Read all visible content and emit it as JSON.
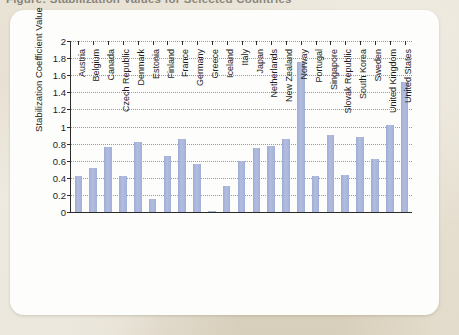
{
  "page": {
    "background_color": "#e8e2d4",
    "card_color": "#fdfdfb",
    "cropped_caption": "Figure: Stabilization Values for Selected Countries"
  },
  "chart_data": {
    "type": "bar",
    "title": "",
    "xlabel": "",
    "ylabel": "Stabilization Coefficient Value",
    "ylim": [
      0,
      2
    ],
    "ytick_step": 0.2,
    "ytick_labels": [
      "0",
      "0.2",
      "0.4",
      "0.6",
      "0.8",
      "1",
      "1.2",
      "1.4",
      "1.6",
      "1.8",
      "2"
    ],
    "grid": true,
    "grid_style": "dotted-horizontal",
    "legend": "none",
    "bar_color": "#a9b6da",
    "axis_color": "#2b2b2b",
    "categories": [
      "Austria",
      "Belgium",
      "Canada",
      "Czech Republic",
      "Denmark",
      "Estonia",
      "Finland",
      "France",
      "Germany",
      "Greece",
      "Iceland",
      "Italy",
      "Japan",
      "Netherlands",
      "New Zealand",
      "Norway",
      "Portugal",
      "Singapore",
      "Slovak Republic",
      "South Korea",
      "Sweden",
      "United Kingdom",
      "United States"
    ],
    "values": [
      0.42,
      0.51,
      0.76,
      0.42,
      0.82,
      0.15,
      0.66,
      0.85,
      0.56,
      0.01,
      0.3,
      0.6,
      0.75,
      0.77,
      0.85,
      1.75,
      0.42,
      0.9,
      0.43,
      0.88,
      0.62,
      1.02,
      1.52
    ]
  }
}
